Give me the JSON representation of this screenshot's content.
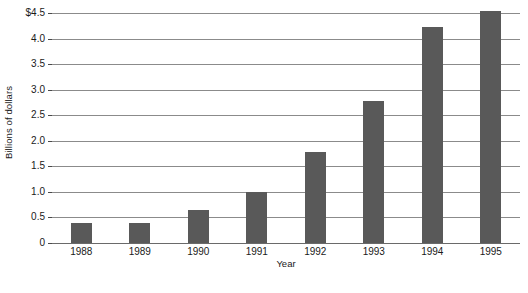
{
  "chart_data": {
    "type": "bar",
    "title": "",
    "subtitle": "",
    "xlabel": "Year",
    "ylabel": "Billions of dollars",
    "categories": [
      "1988",
      "1989",
      "1990",
      "1991",
      "1992",
      "1993",
      "1994",
      "1995"
    ],
    "values": [
      0.39,
      0.39,
      0.65,
      0.99,
      1.78,
      2.78,
      4.23,
      4.53
    ],
    "ylim": [
      0,
      4.5
    ],
    "ytick_values": [
      0,
      0.5,
      1.0,
      1.5,
      2.0,
      2.5,
      3.0,
      3.5,
      4.0,
      4.5
    ],
    "ytick_labels": [
      "0",
      "0.5",
      "1.0",
      "1.5",
      "2.0",
      "2.5",
      "3.0",
      "3.5",
      "4.0",
      "$4.5"
    ],
    "grid": true,
    "legend": null,
    "legend_position": "none",
    "bar_color": "#595959",
    "gridline_color": "#8b8b8b",
    "background_color": "#ffffff",
    "text_color": "#1a1a1a"
  }
}
